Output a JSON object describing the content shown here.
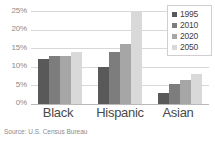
{
  "chart_data": {
    "type": "bar",
    "title": "",
    "subtitle": "",
    "xlabel": "",
    "ylabel": "",
    "categories": [
      "Black",
      "Hispanic",
      "Asian"
    ],
    "series": [
      {
        "name": "1995",
        "color": "#595959",
        "values": [
          12,
          10,
          3
        ]
      },
      {
        "name": "2010",
        "color": "#7d7d7d",
        "values": [
          13,
          14,
          5.5
        ]
      },
      {
        "name": "2020",
        "color": "#a6a6a6",
        "values": [
          13,
          16,
          6.5
        ]
      },
      {
        "name": "2050",
        "color": "#d9d9d9",
        "values": [
          14,
          25,
          8
        ]
      }
    ],
    "ylim": [
      0,
      25
    ],
    "yticks": [
      0,
      5,
      10,
      15,
      20,
      25
    ],
    "ytick_labels": [
      "0%",
      "5%",
      "10%",
      "15%",
      "20%",
      "25%"
    ],
    "grid": true,
    "legend_position": "top-right",
    "annotations": [
      "Source: U.S. Census Bureau"
    ]
  },
  "legend": {
    "entries": [
      {
        "label": "1995"
      },
      {
        "label": "2010"
      },
      {
        "label": "2020"
      },
      {
        "label": "2050"
      }
    ]
  },
  "footer": {
    "source": "Source: U.S. Census Bureau"
  }
}
